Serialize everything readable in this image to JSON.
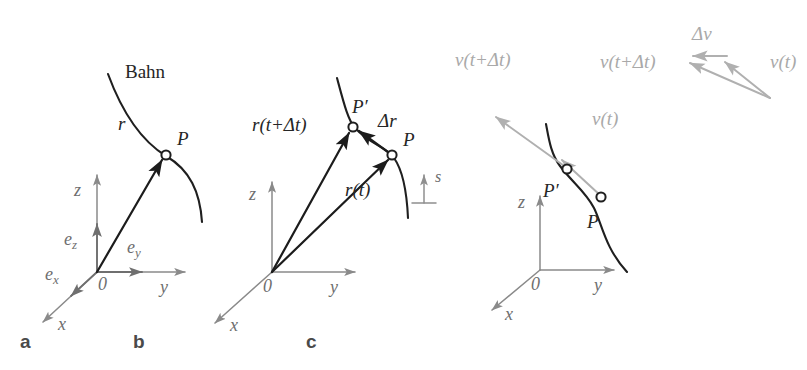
{
  "figure": {
    "background_color": "#ffffff",
    "dark_color": "#1f1f1f",
    "axis_color": "#8a8a8a",
    "grey_color": "#b0b0b0",
    "panels": [
      {
        "letter": "a",
        "curve_label": "Bahn",
        "point_labels": [
          "P"
        ],
        "vectors": [
          "r"
        ],
        "unit_vectors": [
          "e",
          "e",
          "e"
        ],
        "unit_vector_subscripts": [
          "x",
          "y",
          "z"
        ],
        "axes": [
          "x",
          "y",
          "z"
        ],
        "origin_label": "0"
      },
      {
        "letter": "b",
        "point_labels": [
          "P′",
          "P"
        ],
        "vectors": [
          "r(t+Δt)",
          "Δr",
          "r(t)"
        ],
        "arclength_label": "s",
        "axes": [
          "x",
          "y",
          "z"
        ],
        "origin_label": "0"
      },
      {
        "letter": "c",
        "point_labels": [
          "P′",
          "P"
        ],
        "vectors": [
          "v(t+Δt)",
          "v(t)",
          "Δv"
        ],
        "triangle_vectors": [
          "v(t+Δt)",
          "v(t)",
          "Δv"
        ],
        "axes": [
          "x",
          "y",
          "z"
        ],
        "origin_label": "0"
      }
    ]
  },
  "panel_a": {
    "letter": "a",
    "curve_label": "Bahn",
    "point_p": "P",
    "vector_r": "r",
    "axis_x": "x",
    "axis_y": "y",
    "axis_z": "z",
    "origin": "0",
    "ex_base": "e",
    "ex_sub": "x",
    "ey_base": "e",
    "ey_sub": "y",
    "ez_base": "e",
    "ez_sub": "z"
  },
  "panel_b": {
    "letter": "b",
    "point_p_prime": "P′",
    "point_p": "P",
    "vector_r_t_dt": "r(t+Δt)",
    "vector_delta_r": "Δr",
    "vector_r_t": "r(t)",
    "arclength": "s",
    "axis_x": "x",
    "axis_y": "y",
    "axis_z": "z",
    "origin": "0"
  },
  "panel_c": {
    "letter": "c",
    "point_p_prime": "P′",
    "point_p": "P",
    "vector_v_t_dt": "v(t+Δt)",
    "vector_v_t": "v(t)",
    "tri_v_t_dt": "v(t+Δt)",
    "tri_v_t": "v(t)",
    "tri_delta_v": "Δv",
    "axis_x": "x",
    "axis_y": "y",
    "axis_z": "z",
    "origin": "0"
  }
}
